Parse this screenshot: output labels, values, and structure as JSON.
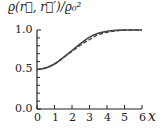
{
  "chart_data": {
    "type": "line",
    "title": "",
    "xlabel": "x",
    "ylabel": "ϱ(r⃗, r⃗′)/ϱ₀²",
    "xlim": [
      0,
      6
    ],
    "ylim": [
      0,
      1
    ],
    "xticks": [
      "0",
      "1",
      "2",
      "3",
      "4",
      "5",
      "6"
    ],
    "yticks": [
      "0.0",
      "0.5",
      "1.0"
    ],
    "grid": false,
    "legend": null,
    "series": [
      {
        "name": "solid",
        "style": "solid",
        "x": [
          0,
          0.5,
          1,
          1.5,
          2,
          2.5,
          3,
          3.5,
          4,
          4.5,
          5,
          6
        ],
        "y": [
          0.5,
          0.52,
          0.57,
          0.65,
          0.74,
          0.83,
          0.91,
          0.96,
          0.985,
          0.995,
          1.0,
          1.0
        ]
      },
      {
        "name": "dashed",
        "style": "dashed",
        "x": [
          0,
          0.5,
          1,
          1.5,
          2,
          2.5,
          3,
          3.5,
          4,
          4.5,
          5,
          6
        ],
        "y": [
          0.5,
          0.52,
          0.57,
          0.65,
          0.73,
          0.81,
          0.88,
          0.94,
          0.97,
          0.99,
          1.0,
          1.0
        ]
      }
    ]
  },
  "labels": {
    "ylabel": "ϱ(r⃗, r⃗′)/ϱ₀²",
    "xvar": "x",
    "y0": "0.0",
    "y05": "0.5",
    "y1": "1.0",
    "x0": "0",
    "x1": "1",
    "x2": "2",
    "x3": "3",
    "x4": "4",
    "x5": "5",
    "x6": "6"
  }
}
